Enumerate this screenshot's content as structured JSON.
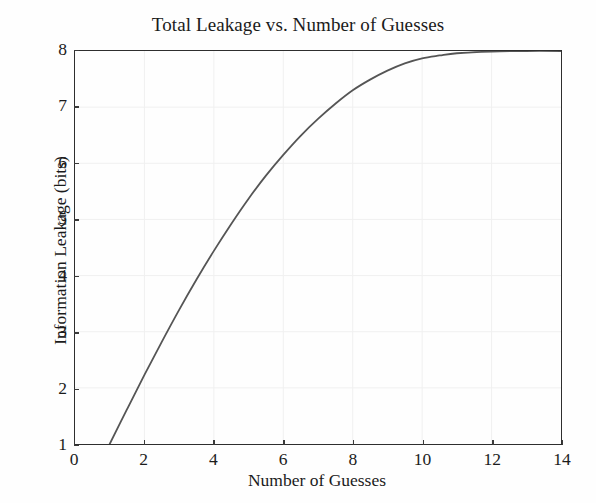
{
  "chart_data": {
    "type": "line",
    "title": "Total Leakage vs. Number of Guesses",
    "xlabel": "Number of Guesses",
    "ylabel": "Information Leakage (bits)",
    "xlim": [
      0,
      14
    ],
    "ylim": [
      1,
      8
    ],
    "xticks": [
      0,
      2,
      4,
      6,
      8,
      10,
      12,
      14
    ],
    "yticks": [
      1,
      2,
      3,
      4,
      5,
      6,
      7,
      8
    ],
    "xtick_labels": [
      "0",
      "2",
      "4",
      "6",
      "8",
      "10",
      "12",
      "14"
    ],
    "ytick_labels": [
      "1",
      "2",
      "3",
      "4",
      "5",
      "6",
      "7",
      "8"
    ],
    "grid": true,
    "grid_color": "#f0f0f0",
    "legend": false,
    "line_color": "#555555",
    "line_width": 1.8,
    "background": "#fefefe",
    "frame_color": "#2e2e2e",
    "series": [
      {
        "name": "Total Leakage",
        "x": [
          1,
          1.5,
          2,
          2.5,
          3,
          3.5,
          4,
          4.5,
          5,
          5.5,
          6,
          6.5,
          7,
          7.5,
          8,
          8.5,
          9,
          9.5,
          10,
          10.5,
          11,
          12,
          13,
          14
        ],
        "values": [
          1.0,
          1.62,
          2.23,
          2.82,
          3.39,
          3.93,
          4.44,
          4.92,
          5.37,
          5.78,
          6.15,
          6.49,
          6.79,
          7.06,
          7.3,
          7.49,
          7.65,
          7.78,
          7.87,
          7.92,
          7.96,
          7.99,
          8.0,
          8.0
        ]
      }
    ]
  }
}
